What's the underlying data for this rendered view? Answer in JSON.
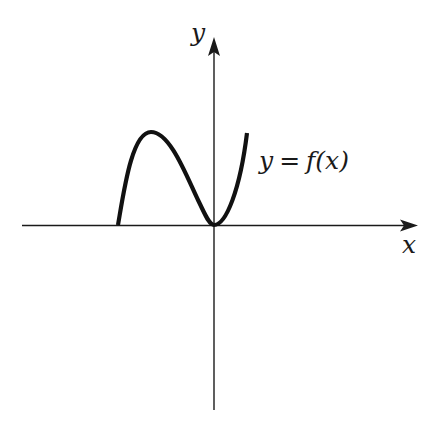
{
  "diagram": {
    "type": "function-graph",
    "axes": {
      "x_label": "x",
      "y_label": "y",
      "x_axis_arrow": "right",
      "y_axis_arrow": "up"
    },
    "curve": {
      "label_lhs": "y",
      "label_eq": "=",
      "label_rhs": "f(x)",
      "description": "Curve starting on the negative x-axis, rising to a local maximum, descending to touch the origin (local minimum tangent to x-axis), then rising steeply to the right.",
      "features": {
        "left_endpoint": "on negative x-axis",
        "local_maximum": "in second quadrant",
        "local_minimum": "at origin, tangent to x-axis",
        "right_end": "rising in first quadrant"
      }
    },
    "colors": {
      "background": "#ffffff",
      "ink": "#111111"
    }
  }
}
